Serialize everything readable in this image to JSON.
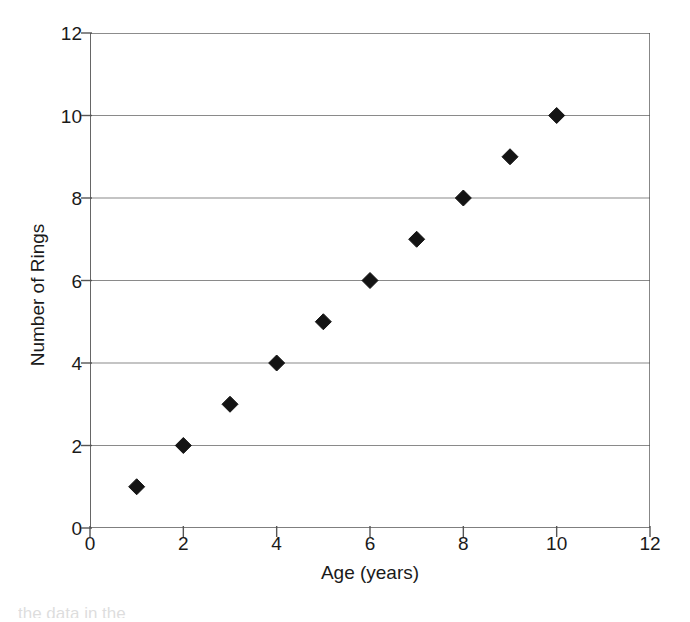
{
  "figure": {
    "background_color": "#ffffff",
    "axis_color": "#555555",
    "grid_color": "#8a8a8a",
    "marker_color": "#141414",
    "text_color": "#1a1a1a"
  },
  "chart_data": {
    "type": "scatter",
    "title": "",
    "xlabel": "Age (years)",
    "ylabel": "Number of Rings",
    "xlim": [
      0,
      12
    ],
    "ylim": [
      0,
      12
    ],
    "xticks": [
      0,
      2,
      4,
      6,
      8,
      10,
      12
    ],
    "yticks": [
      0,
      2,
      4,
      6,
      8,
      10,
      12
    ],
    "xtick_labels": [
      "0",
      "2",
      "4",
      "6",
      "8",
      "10",
      "12"
    ],
    "ytick_labels": [
      "0",
      "2",
      "4",
      "6",
      "8",
      "10",
      "12"
    ],
    "grid": {
      "horizontal": true,
      "vertical": false,
      "at_values": [
        2,
        4,
        6,
        8,
        10,
        12
      ]
    },
    "legend": null,
    "marker": {
      "shape": "diamond",
      "color": "#141414",
      "size": 13
    },
    "x": [
      1,
      2,
      3,
      4,
      5,
      6,
      7,
      8,
      9,
      10
    ],
    "y": [
      1,
      2,
      3,
      4,
      5,
      6,
      7,
      8,
      9,
      10
    ],
    "points": [
      {
        "x": 1,
        "y": 1
      },
      {
        "x": 2,
        "y": 2
      },
      {
        "x": 3,
        "y": 3
      },
      {
        "x": 4,
        "y": 4
      },
      {
        "x": 5,
        "y": 5
      },
      {
        "x": 6,
        "y": 6
      },
      {
        "x": 7,
        "y": 7
      },
      {
        "x": 8,
        "y": 8
      },
      {
        "x": 9,
        "y": 9
      },
      {
        "x": 10,
        "y": 10
      }
    ]
  },
  "caption_artifact": "the data in the"
}
